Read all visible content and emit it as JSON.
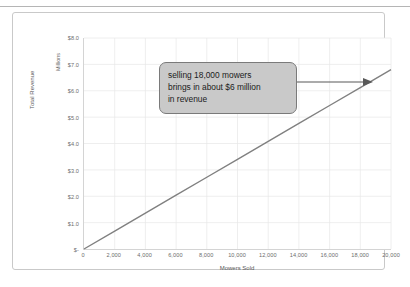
{
  "chart": {
    "y_unit_label": "Millions",
    "y_axis_title": "Total Revenue",
    "x_axis_title": "Mowers Sold"
  },
  "callout": {
    "line1": "selling 18,000 mowers",
    "line2": "brings in about $6 million",
    "line3": "in revenue",
    "fill_color": "#c9c9c9",
    "border_color": "#7a7a7a",
    "arrow_color": "#595959"
  },
  "chart_data": {
    "type": "line",
    "title": "",
    "subtitle": "",
    "xlabel": "Mowers Sold",
    "ylabel": "Total Revenue",
    "y_unit": "Millions",
    "xlim": [
      0,
      20000
    ],
    "ylim": [
      0,
      8.0
    ],
    "grid": true,
    "legend": "none",
    "series_color": "#808080",
    "x_ticklabels": [
      "0",
      "2,000",
      "4,000",
      "6,000",
      "8,000",
      "10,000",
      "12,000",
      "14,000",
      "16,000",
      "18,000",
      "20,000"
    ],
    "x_tickvalues": [
      0,
      2000,
      4000,
      6000,
      8000,
      10000,
      12000,
      14000,
      16000,
      18000,
      20000
    ],
    "y_ticklabels": [
      "$-",
      "$1.0",
      "$2.0",
      "$3.0",
      "$4.0",
      "$5.0",
      "$6.0",
      "$7.0",
      "$8.0"
    ],
    "y_tickvalues": [
      0,
      1.0,
      2.0,
      3.0,
      4.0,
      5.0,
      6.0,
      7.0,
      8.0
    ],
    "series": [
      {
        "name": "Total Revenue",
        "x": [
          0,
          2000,
          4000,
          6000,
          8000,
          10000,
          12000,
          14000,
          16000,
          18000,
          20000
        ],
        "values": [
          0,
          0.68,
          1.36,
          2.04,
          2.72,
          3.4,
          4.08,
          4.76,
          5.44,
          6.12,
          6.8
        ]
      }
    ],
    "annotations": [
      {
        "text": "selling 18,000 mowers brings in about $6 million in revenue",
        "points_to_x": 18000,
        "points_to_y": 6.0
      }
    ]
  }
}
